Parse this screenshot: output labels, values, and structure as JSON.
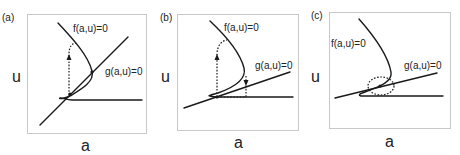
{
  "figure": {
    "panels": [
      {
        "id": "a",
        "panel_label": "(a)",
        "xlabel": "a",
        "ylabel": "u",
        "curve_f_label": "f(a,u)=0",
        "curve_g_label": "g(a,u)=0",
        "annotation": "dotted trajectory with upward arrow following f-curve"
      },
      {
        "id": "b",
        "panel_label": "(b)",
        "xlabel": "a",
        "ylabel": "u",
        "curve_f_label": "f(a,u)=0",
        "curve_g_label": "g(a,u)=0",
        "annotation": "dotted relaxation loop with up and down arrows"
      },
      {
        "id": "c",
        "panel_label": "(c)",
        "xlabel": "a",
        "ylabel": "u",
        "curve_f_label": "f(a,u)=0",
        "curve_g_label": "g(a,u)=0",
        "annotation": "dotted circle around intersection"
      }
    ],
    "colors": {
      "curve": "#1a1a1a",
      "frame": "#c8c8c8",
      "background": "#ffffff"
    }
  }
}
